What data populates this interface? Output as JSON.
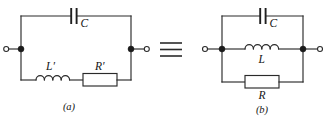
{
  "figure": {
    "type": "circuit-diagram",
    "background_color": "#ffffff",
    "line_color": "#2a2a2a",
    "equivalence_symbol": "≡"
  },
  "circuit_a": {
    "caption": "(a)",
    "topology": "series L'-R' branch in parallel with C",
    "components": [
      {
        "id": "cap-a",
        "symbol": "capacitor",
        "label": "C",
        "branch": "top"
      },
      {
        "id": "ind-a",
        "symbol": "inductor",
        "label": "L'",
        "branch": "bottom-left",
        "coil_humps": 4
      },
      {
        "id": "res-a",
        "symbol": "resistor",
        "label": "R'",
        "branch": "bottom-right"
      }
    ],
    "terminals": [
      {
        "id": "term-a-left",
        "side": "left",
        "style": "open-circle"
      },
      {
        "id": "term-a-right",
        "side": "right",
        "style": "open-circle"
      }
    ],
    "nodes": [
      {
        "id": "node-a-left",
        "style": "filled-dot"
      },
      {
        "id": "node-a-right",
        "style": "filled-dot"
      }
    ]
  },
  "circuit_b": {
    "caption": "(b)",
    "topology": "C, L and R all in parallel",
    "components": [
      {
        "id": "cap-b",
        "symbol": "capacitor",
        "label": "C",
        "branch": "top"
      },
      {
        "id": "ind-b",
        "symbol": "inductor",
        "label": "L",
        "branch": "middle",
        "coil_humps": 4
      },
      {
        "id": "res-b",
        "symbol": "resistor",
        "label": "R",
        "branch": "bottom"
      }
    ],
    "terminals": [
      {
        "id": "term-b-left",
        "side": "left",
        "style": "open-circle"
      },
      {
        "id": "term-b-right",
        "side": "right",
        "style": "open-circle"
      }
    ],
    "nodes": [
      {
        "id": "node-b-left",
        "style": "filled-dot"
      },
      {
        "id": "node-b-right",
        "style": "filled-dot"
      }
    ]
  },
  "labels": {
    "cap_a": "C",
    "ind_a": "L′",
    "res_a": "R′",
    "cap_b": "C",
    "ind_b": "L",
    "res_b": "R",
    "caption_a": "(a)",
    "caption_b": "(b)"
  }
}
